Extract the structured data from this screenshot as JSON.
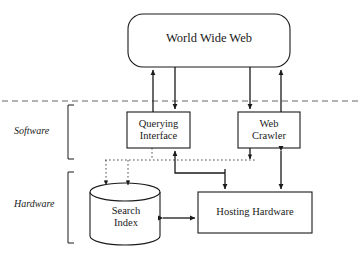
{
  "diagram": {
    "background": "#ffffff",
    "stroke": "#1a1a1a",
    "fill": "#ffffff",
    "tiers": [
      {
        "id": "software",
        "label": "Software"
      },
      {
        "id": "hardware",
        "label": "Hardware"
      }
    ],
    "nodes": [
      {
        "id": "www",
        "label": "World Wide Web",
        "shape": "rounded-rectangle"
      },
      {
        "id": "querying_interface",
        "label": "Querying\nInterface",
        "line1": "Querying",
        "line2": "Interface",
        "shape": "rectangle"
      },
      {
        "id": "web_crawler",
        "label": "Web\nCrawler",
        "line1": "Web",
        "line2": "Crawler",
        "shape": "rectangle"
      },
      {
        "id": "search_index",
        "label": "Search\nIndex",
        "line1": "Search",
        "line2": "Index",
        "shape": "cylinder"
      },
      {
        "id": "hosting_hardware",
        "label": "Hosting Hardware",
        "line1": "Hosting Hardware",
        "line2": "",
        "shape": "rectangle"
      }
    ],
    "edges": [
      {
        "id": "www-to-qi-up",
        "from": "querying_interface",
        "to": "www",
        "style": "solid",
        "arrow": "end"
      },
      {
        "id": "www-to-qi-down",
        "from": "www",
        "to": "querying_interface",
        "style": "solid",
        "arrow": "end"
      },
      {
        "id": "www-to-wc-down",
        "from": "www",
        "to": "web_crawler",
        "style": "solid",
        "arrow": "end"
      },
      {
        "id": "wc-to-www-up",
        "from": "web_crawler",
        "to": "www",
        "style": "solid",
        "arrow": "end"
      },
      {
        "id": "hh-to-qi",
        "from": "hosting_hardware",
        "to": "querying_interface",
        "style": "solid",
        "arrow": "end"
      },
      {
        "id": "bus-to-hh",
        "from": "bus",
        "to": "hosting_hardware",
        "style": "solid",
        "arrow": "end"
      },
      {
        "id": "wc-to-bus",
        "from": "web_crawler",
        "to": "bus",
        "style": "solid",
        "arrow": "end"
      },
      {
        "id": "wc-hh-bidir",
        "from": "web_crawler",
        "to": "hosting_hardware",
        "style": "solid",
        "arrow": "both"
      },
      {
        "id": "si-hh-bidir",
        "from": "search_index",
        "to": "hosting_hardware",
        "style": "solid",
        "arrow": "both"
      },
      {
        "id": "bus-to-si-left",
        "from": "bus",
        "to": "search_index",
        "style": "dotted",
        "arrow": "end"
      },
      {
        "id": "bus-to-si-right",
        "from": "bus",
        "to": "search_index",
        "style": "dotted",
        "arrow": "end"
      },
      {
        "id": "qi-to-bus",
        "from": "querying_interface",
        "to": "bus",
        "style": "dotted",
        "arrow": "none"
      },
      {
        "id": "dotted-bus",
        "from": "bus-left",
        "to": "bus-right",
        "style": "dotted",
        "arrow": "none"
      }
    ],
    "separator": {
      "id": "tier-divider",
      "style": "dashed",
      "orientation": "horizontal"
    }
  }
}
